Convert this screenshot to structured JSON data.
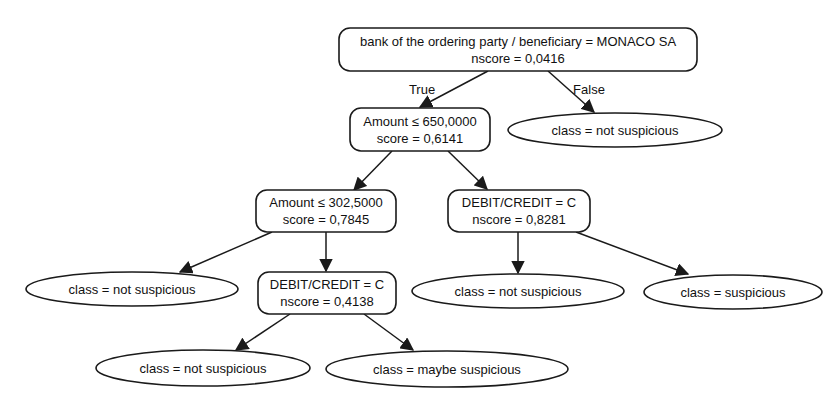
{
  "diagram": {
    "type": "decision-tree",
    "nodes": {
      "root": {
        "kind": "decision",
        "condition": "bank of the ordering party / beneficiary = MONACO SA",
        "score": "nscore = 0,0416"
      },
      "amount650": {
        "kind": "decision",
        "condition": "Amount ≤ 650,0000",
        "score": "score = 0,6141"
      },
      "leaf_root_false": {
        "kind": "leaf",
        "label": "class = not suspicious"
      },
      "amount302": {
        "kind": "decision",
        "condition": "Amount ≤ 302,5000",
        "score": "score = 0,7845"
      },
      "dc1": {
        "kind": "decision",
        "condition": "DEBIT/CREDIT = C",
        "score": "nscore = 0,8281"
      },
      "leaf_a302_left": {
        "kind": "leaf",
        "label": "class = not suspicious"
      },
      "dc2": {
        "kind": "decision",
        "condition": "DEBIT/CREDIT = C",
        "score": "nscore = 0,4138"
      },
      "leaf_dc1_left": {
        "kind": "leaf",
        "label": "class = not suspicious"
      },
      "leaf_dc1_right": {
        "kind": "leaf",
        "label": "class = suspicious"
      },
      "leaf_dc2_left": {
        "kind": "leaf",
        "label": "class = not suspicious"
      },
      "leaf_dc2_right": {
        "kind": "leaf",
        "label": "class = maybe suspicious"
      }
    },
    "edges": [
      {
        "from": "root",
        "to": "amount650",
        "label": "True"
      },
      {
        "from": "root",
        "to": "leaf_root_false",
        "label": "False"
      },
      {
        "from": "amount650",
        "to": "amount302",
        "label": ""
      },
      {
        "from": "amount650",
        "to": "dc1",
        "label": ""
      },
      {
        "from": "amount302",
        "to": "leaf_a302_left",
        "label": ""
      },
      {
        "from": "amount302",
        "to": "dc2",
        "label": ""
      },
      {
        "from": "dc1",
        "to": "leaf_dc1_left",
        "label": ""
      },
      {
        "from": "dc1",
        "to": "leaf_dc1_right",
        "label": ""
      },
      {
        "from": "dc2",
        "to": "leaf_dc2_left",
        "label": ""
      },
      {
        "from": "dc2",
        "to": "leaf_dc2_right",
        "label": ""
      }
    ],
    "edge_labels": {
      "true_label": "True",
      "false_label": "False"
    }
  }
}
